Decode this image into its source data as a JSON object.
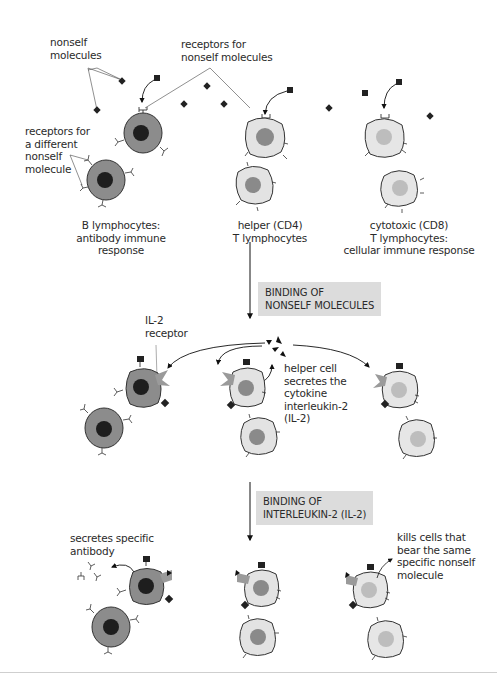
{
  "colors": {
    "b_cell_body": "#8c8c8c",
    "b_cell_nucleus": "#1e1e1e",
    "helper_body": "#e3e3e3",
    "helper_nucleus": "#8a8a8a",
    "cytotoxic_body": "#e6e6e6",
    "cytotoxic_nucleus": "#bdbdbd",
    "il2_receptor": "#9a9a9a",
    "step_box": "#dcdcdc",
    "molecule": "#222222"
  },
  "labels": {
    "nonself_molecules": "nonself\nmolecules",
    "receptors_for_nonself": "receptors for\nnonself molecules",
    "receptors_different": "receptors for\na different\nnonself\nmolecule",
    "b_lymphocytes": "B lymphocytes:\nantibody immune\nresponse",
    "helper_t": "helper (CD4)\nT lymphocytes",
    "cytotoxic_t": "cytotoxic (CD8)\nT lymphocytes:\ncellular immune response",
    "il2_receptor": "IL-2\nreceptor",
    "helper_secretes": "helper cell\nsecretes the\ncytokine\ninterleukin-2\n(IL-2)",
    "secretes_antibody": "secretes specific\nantibody",
    "kills_cells": "kills cells that\nbear the same\nspecific nonself\nmolecule"
  },
  "steps": [
    {
      "label": "BINDING OF\nNONSELF MOLECULES"
    },
    {
      "label": "BINDING OF\nINTERLEUKIN-2 (IL-2)"
    }
  ],
  "stages": [
    {
      "name": "before binding",
      "columns": [
        "B lymphocytes",
        "helper (CD4) T lymphocytes",
        "cytotoxic (CD8) T lymphocytes"
      ]
    },
    {
      "name": "after binding of nonself molecules"
    },
    {
      "name": "after binding of interleukin-2"
    }
  ]
}
